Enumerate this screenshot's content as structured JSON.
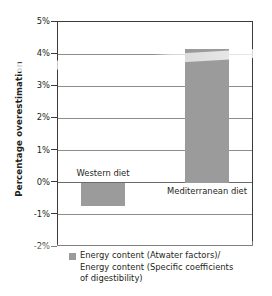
{
  "chart_data": {
    "type": "bar",
    "title": "",
    "subtitle": "",
    "xlabel": "",
    "ylabel": "Percentage overestimation",
    "categories": [
      "Western diet",
      "Mediterranean diet"
    ],
    "values": [
      -0.72,
      4.15
    ],
    "series": [
      {
        "name": "Energy content (Atwater factors)/Energy content (Specific coefficients of digestibility)",
        "values": [
          -0.72,
          4.15
        ]
      }
    ],
    "ylim": [
      -2,
      5
    ],
    "yticks": [
      5,
      4,
      3,
      2,
      1,
      0,
      -1,
      -2
    ],
    "ytick_labels": [
      "5%",
      "4%",
      "3%",
      "2%",
      "1%",
      "0%",
      "-1%",
      "-2%"
    ],
    "grid": true,
    "legend_position": "bottom",
    "bar_color": "#9b9b9b",
    "axis_color": "#3b3b3b",
    "grid_color": "#8d8d8d",
    "legend": [
      {
        "swatch_color": "#9b9b9b",
        "lines": [
          "Energy content (Atwater factors)/",
          "Energy content (Specific coefficients",
          "of digestibility)"
        ]
      }
    ]
  },
  "axis": {
    "y_title": "Percentage overestimation",
    "ticks": [
      {
        "label": "5%",
        "value": 5
      },
      {
        "label": "4%",
        "value": 4
      },
      {
        "label": "3%",
        "value": 3
      },
      {
        "label": "2%",
        "value": 2
      },
      {
        "label": "1%",
        "value": 1
      },
      {
        "label": "0%",
        "value": 0
      },
      {
        "label": "-1%",
        "value": -1
      },
      {
        "label": "-2%",
        "value": -2
      }
    ]
  },
  "bars": [
    {
      "label": "Western diet",
      "value": -0.72
    },
    {
      "label": "Mediterranean diet",
      "value": 4.15
    }
  ],
  "legend": {
    "line1": "Energy content (Atwater factors)/",
    "line2": "Energy content (Specific coefficients",
    "line3": "of digestibility)"
  }
}
